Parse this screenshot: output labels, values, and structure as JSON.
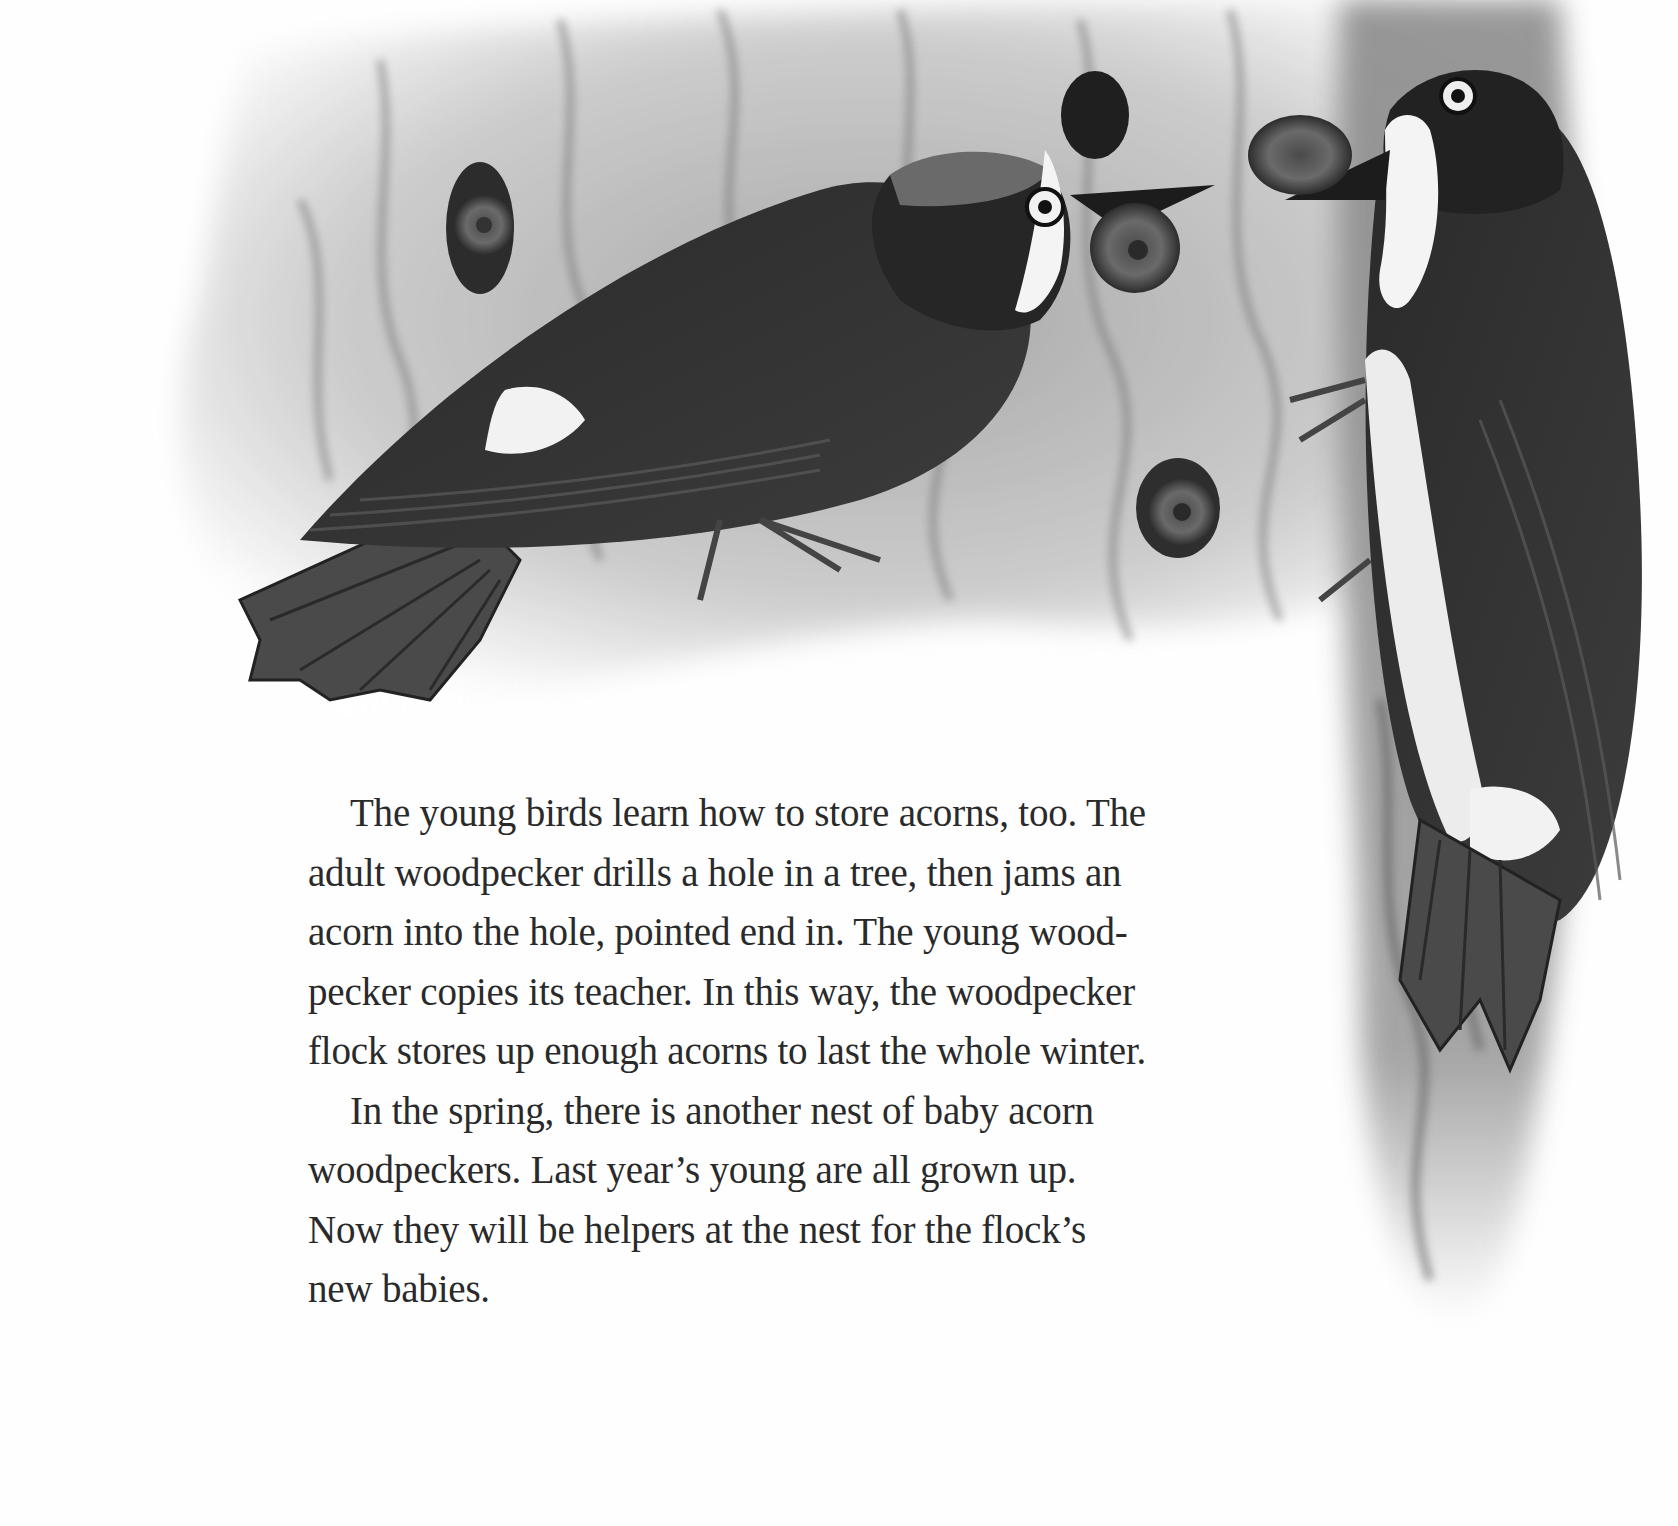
{
  "page": {
    "type": "picture-book page",
    "illustration": {
      "description": "Pencil illustration of two acorn woodpeckers on a tree trunk storing acorns in holes",
      "subjects": [
        {
          "name": "young-woodpecker",
          "detail": "perched diagonally on bark, holding acorn in beak, pushing it into a hole"
        },
        {
          "name": "adult-woodpecker",
          "detail": "clinging vertically to the trunk at right, holding an acorn in beak"
        }
      ],
      "acorns_visible": 5,
      "palette": {
        "ink": "#1c1c1c",
        "bark_dark": "#5a5a5a",
        "bark_light": "#b8b8b8",
        "paper": "#fefefe",
        "text": "#2a2a2a"
      }
    },
    "text": {
      "paragraphs": [
        {
          "lines": [
            "The young birds learn how to store acorns, too. The",
            "adult woodpecker drills a hole in a tree, then jams an",
            "acorn into the hole, pointed end in. The young wood-",
            "pecker copies its teacher. In this way, the woodpecker",
            "flock stores up enough acorns to last the whole winter."
          ]
        },
        {
          "lines": [
            "In the spring, there is another nest of baby acorn",
            "woodpeckers. Last year’s young are all grown up.",
            "Now they will be helpers at the nest for the flock’s",
            "new babies."
          ]
        }
      ]
    }
  }
}
